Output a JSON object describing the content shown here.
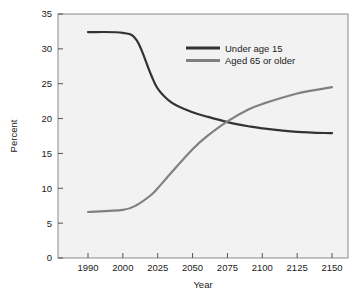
{
  "chart_data": {
    "type": "line",
    "title": "",
    "xlabel": "Year",
    "ylabel": "Percent",
    "ylim": [
      0,
      35
    ],
    "yticks": [
      0,
      5,
      10,
      15,
      20,
      25,
      30,
      35
    ],
    "xticks": [
      "1990",
      "2000",
      "2025",
      "2050",
      "2075",
      "2100",
      "2125",
      "2150"
    ],
    "xtick_values": [
      1990,
      2000,
      2025,
      2050,
      2075,
      2100,
      2125,
      2150
    ],
    "grid": false,
    "legend_position": "top-right",
    "plot_background": "#f2f2f2",
    "axis_color": "#555555",
    "series": [
      {
        "name": "Under age 15",
        "color": "#333333",
        "x": [
          1990,
          2000,
          2010,
          2020,
          2025,
          2035,
          2050,
          2060,
          2075,
          2090,
          2100,
          2125,
          2150
        ],
        "values": [
          32.4,
          32.3,
          31.2,
          26.4,
          24.3,
          22.3,
          20.9,
          20.3,
          19.5,
          18.9,
          18.6,
          18.1,
          17.9
        ]
      },
      {
        "name": "Aged 65 or older",
        "color": "#808080",
        "x": [
          1990,
          2000,
          2010,
          2020,
          2025,
          2035,
          2050,
          2060,
          2075,
          2090,
          2100,
          2125,
          2150
        ],
        "values": [
          6.6,
          6.9,
          7.6,
          9.0,
          10.0,
          12.3,
          15.6,
          17.4,
          19.6,
          21.3,
          22.1,
          23.6,
          24.5
        ]
      }
    ],
    "crossover": {
      "x": 2072,
      "y": 19.5
    }
  },
  "legend": {
    "items": [
      {
        "label": "Under age 15",
        "color": "#333333"
      },
      {
        "label": "Aged 65 or older",
        "color": "#808080"
      }
    ]
  },
  "axes": {
    "y_title": "Percent",
    "x_title": "Year",
    "y_labels": [
      "35",
      "30",
      "25",
      "20",
      "15",
      "10",
      "5",
      "0"
    ],
    "x_labels": [
      "1990",
      "2000",
      "2025",
      "2050",
      "2075",
      "2100",
      "2125",
      "2150"
    ]
  }
}
